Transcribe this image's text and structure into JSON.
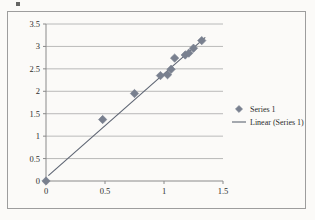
{
  "figure": {
    "background_color": "#fbfaf8",
    "frame_color": "#9d9d9d",
    "artifact_name": "scan-speck"
  },
  "chart_data": {
    "type": "scatter",
    "title": "",
    "subtitle": "",
    "xlabel": "",
    "ylabel": "",
    "xlim": [
      0,
      1.5
    ],
    "ylim": [
      0,
      3.5
    ],
    "x_ticks": [
      0,
      0.5,
      1,
      1.5
    ],
    "x_tick_labels": [
      "0",
      "0.5",
      "1",
      "1.5"
    ],
    "y_ticks": [
      0,
      0.5,
      1,
      1.5,
      2,
      2.5,
      3,
      3.5
    ],
    "y_tick_labels": [
      "0",
      "0.5",
      "1",
      "1.5",
      "2",
      "2.5",
      "3",
      "3.5"
    ],
    "grid": "horizontal",
    "grid_color": "#a8a8a8",
    "axis_color": "#8a8a8a",
    "legend_position": "right",
    "marker_color": "#79808f",
    "marker_shape": "diamond",
    "trendline_color": "#5d6472",
    "series": [
      {
        "name": "Series 1",
        "kind": "scatter",
        "x": [
          0,
          0.48,
          0.75,
          0.97,
          1.03,
          1.06,
          1.09,
          1.18,
          1.21,
          1.25,
          1.32
        ],
        "y": [
          0,
          1.37,
          1.95,
          2.35,
          2.37,
          2.49,
          2.74,
          2.81,
          2.85,
          2.96,
          3.13
        ]
      },
      {
        "name": "Linear (Series 1)",
        "kind": "trendline",
        "x": [
          0.02,
          1.35
        ],
        "y": [
          0.12,
          3.2
        ]
      }
    ]
  },
  "legend": {
    "items": [
      {
        "label": "Series 1",
        "marker": "diamond-marker",
        "color": "#79808f"
      },
      {
        "label": "Linear (Series 1)",
        "marker": "line-marker",
        "color": "#5d6472"
      }
    ]
  }
}
